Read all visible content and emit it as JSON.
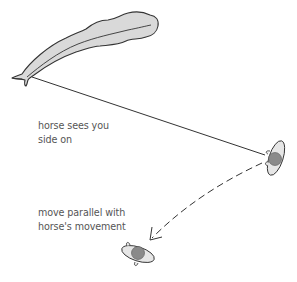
{
  "diagram": {
    "title": "",
    "annotations": {
      "side_on": {
        "lines": [
          "horse sees you",
          "side on"
        ]
      },
      "move_parallel": {
        "lines": [
          "move parallel with",
          "horse's movement"
        ]
      }
    },
    "elements": {
      "horse": {
        "icon": "horse-top-view-icon"
      },
      "person_start": {
        "icon": "person-top-view-icon"
      },
      "person_end": {
        "icon": "person-top-view-icon"
      },
      "sightline": {
        "style": "solid"
      },
      "movement_path": {
        "style": "dashed",
        "end": "arrow"
      }
    },
    "colors": {
      "outline": "#333333",
      "horse_fill": "#d9d9d9",
      "body_fill": "#e6e6e6",
      "head_fill": "#8a8a8a",
      "text": "#555555",
      "line": "#333333"
    }
  }
}
